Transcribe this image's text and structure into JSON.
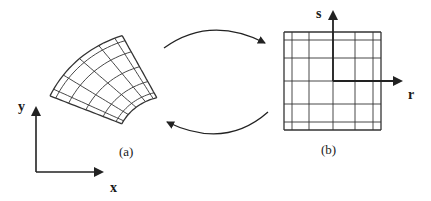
{
  "figure": {
    "left_panel": {
      "caption": "(a)",
      "axis_x_label": "x",
      "axis_y_label": "y",
      "grid_description": "curved (distorted) quadrilateral mesh, 6 x 6 cells"
    },
    "right_panel": {
      "caption": "(b)",
      "axis_r_label": "r",
      "axis_s_label": "s",
      "grid_description": "square reference mesh, 6 x 6 cells"
    },
    "arrows": [
      {
        "from": "a",
        "to": "b",
        "meaning": "forward mapping"
      },
      {
        "from": "b",
        "to": "a",
        "meaning": "inverse mapping"
      }
    ],
    "colors": {
      "ink": "#222222",
      "background": "#ffffff"
    }
  }
}
